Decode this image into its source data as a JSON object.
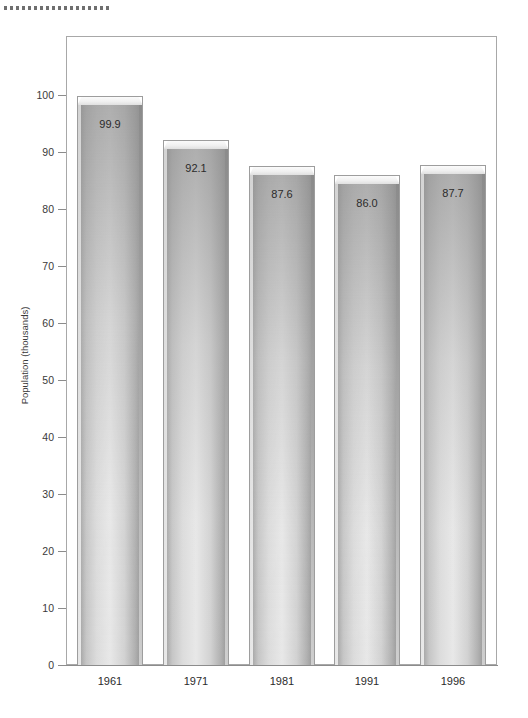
{
  "decoration": {
    "dot_rule_count": 18,
    "dot_color": "#6f6f6f"
  },
  "chart_data": {
    "type": "bar",
    "title": "",
    "subtitle": "",
    "xlabel": "",
    "ylabel": "Population (thousands)",
    "categories": [
      "1961",
      "1971",
      "1981",
      "1991",
      "1996"
    ],
    "values": [
      99.9,
      92.1,
      87.6,
      86.0,
      87.7
    ],
    "value_labels": [
      "99.9",
      "92.1",
      "87.6",
      "86.0",
      "87.7"
    ],
    "ylim": [
      0,
      100
    ],
    "ytick_values": [
      0,
      10,
      20,
      30,
      40,
      50,
      60,
      70,
      80,
      90,
      100
    ],
    "ytick_labels": [
      "0",
      "10",
      "20",
      "30",
      "40",
      "50",
      "60",
      "70",
      "80",
      "90",
      "100"
    ],
    "grid": false,
    "legend": null,
    "bar_style": "3d-beveled-gradient",
    "frame_color": "#a8a8a8",
    "axis_color": "#8c8c8c",
    "bar_fill_light": "#e8e8e8",
    "bar_fill_dark": "#8e8e8e",
    "text_color": "#2b2b2b"
  }
}
